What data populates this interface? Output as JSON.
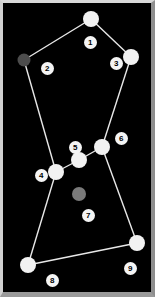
{
  "figure": {
    "background_color": "#000000",
    "border_color": "#cfcfcf",
    "edge_color": "#e8e8e8",
    "default_node_color": "#f2f2f2",
    "label_background": "#f4f4f4",
    "label_text_color": "#000000",
    "width": 155,
    "height": 297
  },
  "graph": {
    "nodes": [
      {
        "id": "1",
        "label": "1",
        "x": 91,
        "y": 19,
        "r": 8,
        "color": "#f2f2f2",
        "label_x": 87,
        "label_y": 39
      },
      {
        "id": "2",
        "label": "2",
        "x": 24,
        "y": 60,
        "r": 6.5,
        "color": "#4c4c4c",
        "label_x": 44,
        "label_y": 65
      },
      {
        "id": "3",
        "label": "3",
        "x": 131,
        "y": 57,
        "r": 8,
        "color": "#f2f2f2",
        "label_x": 113,
        "label_y": 60
      },
      {
        "id": "4",
        "label": "4",
        "x": 56,
        "y": 172,
        "r": 8,
        "color": "#f2f2f2",
        "label_x": 38,
        "label_y": 172
      },
      {
        "id": "5",
        "label": "5",
        "x": 79,
        "y": 160,
        "r": 8,
        "color": "#f2f2f2",
        "label_x": 72,
        "label_y": 144
      },
      {
        "id": "6",
        "label": "6",
        "x": 102,
        "y": 147,
        "r": 8,
        "color": "#f2f2f2",
        "label_x": 118,
        "label_y": 135
      },
      {
        "id": "7",
        "label": "7",
        "x": 79,
        "y": 194,
        "r": 7,
        "color": "#7a7a7a",
        "label_x": 85,
        "label_y": 212
      },
      {
        "id": "8",
        "label": "8",
        "x": 28,
        "y": 265,
        "r": 8,
        "color": "#f2f2f2",
        "label_x": 49,
        "label_y": 277
      },
      {
        "id": "9",
        "label": "9",
        "x": 137,
        "y": 243,
        "r": 8,
        "color": "#f2f2f2",
        "label_x": 127,
        "label_y": 265
      }
    ],
    "edges": [
      {
        "source": "2",
        "target": "1"
      },
      {
        "source": "1",
        "target": "3"
      },
      {
        "source": "3",
        "target": "6"
      },
      {
        "source": "6",
        "target": "5"
      },
      {
        "source": "5",
        "target": "4"
      },
      {
        "source": "4",
        "target": "2"
      },
      {
        "source": "4",
        "target": "8"
      },
      {
        "source": "6",
        "target": "9"
      },
      {
        "source": "8",
        "target": "9"
      }
    ],
    "isolated_nodes": [
      "7"
    ],
    "node_count": 9,
    "edge_count": 9
  }
}
